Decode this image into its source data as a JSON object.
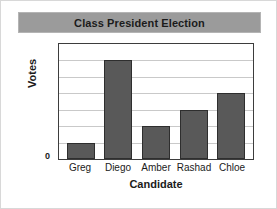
{
  "chart_data": {
    "type": "bar",
    "title": "Class President Election",
    "xlabel": "Candidate",
    "ylabel": "Votes",
    "categories": [
      "Greg",
      "Diego",
      "Amber",
      "Rashad",
      "Chloe"
    ],
    "values": [
      1,
      6,
      2,
      3,
      4
    ],
    "ylim": [
      0,
      7
    ],
    "y_tick_labels": [
      "0"
    ],
    "gridlines": 6,
    "grid": true,
    "legend": "none",
    "bar_color": "#595959",
    "bar_edge_color": "#2e2e2e",
    "grid_color": "#c9c9c9",
    "plot_border_color": "#3d3d3d",
    "title_band_color": "#9b9b9b",
    "text_color": "#1b1b1b"
  }
}
